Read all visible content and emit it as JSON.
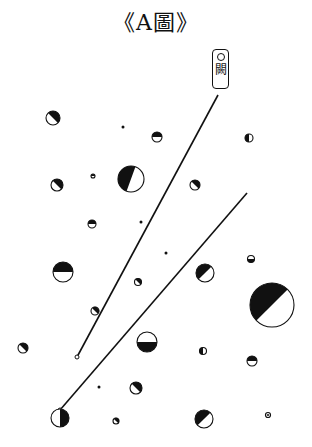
{
  "title": "《A圖》",
  "label": {
    "symbol": "○",
    "char": "闕"
  },
  "colors": {
    "ink": "#111111",
    "paper": "#ffffff"
  },
  "lines": [
    {
      "name": "line-1",
      "x1": 218,
      "y1": 95,
      "x2": 77,
      "y2": 357,
      "end_marker": "open-circle"
    },
    {
      "name": "line-2",
      "x1": 247,
      "y1": 193,
      "x2": 60,
      "y2": 410,
      "end_marker": "open-circle"
    }
  ],
  "circles": [
    {
      "cx": 53,
      "cy": 118,
      "r": 7,
      "shade": "upper-left"
    },
    {
      "cx": 123,
      "cy": 127,
      "r": 1.5,
      "shade": "dot"
    },
    {
      "cx": 157,
      "cy": 137,
      "r": 5,
      "shade": "left"
    },
    {
      "cx": 249,
      "cy": 138,
      "r": 4,
      "shade": "bottom"
    },
    {
      "cx": 57,
      "cy": 185,
      "r": 6,
      "shade": "upper-left"
    },
    {
      "cx": 93,
      "cy": 176,
      "r": 2,
      "shade": "left"
    },
    {
      "cx": 131,
      "cy": 179,
      "r": 13,
      "shade": "lower"
    },
    {
      "cx": 195,
      "cy": 185,
      "r": 5,
      "shade": "upper-left"
    },
    {
      "cx": 92,
      "cy": 224,
      "r": 4,
      "shade": "left"
    },
    {
      "cx": 141,
      "cy": 222,
      "r": 1.5,
      "shade": "dot"
    },
    {
      "cx": 63,
      "cy": 272,
      "r": 10,
      "shade": "left"
    },
    {
      "cx": 166,
      "cy": 253,
      "r": 1.5,
      "shade": "dot"
    },
    {
      "cx": 205,
      "cy": 273,
      "r": 9,
      "shade": "lower-left"
    },
    {
      "cx": 251,
      "cy": 259,
      "r": 3.5,
      "shade": "right"
    },
    {
      "cx": 138,
      "cy": 282,
      "r": 3.5,
      "shade": "upper-left"
    },
    {
      "cx": 95,
      "cy": 311,
      "r": 4,
      "shade": "upper-left"
    },
    {
      "cx": 147,
      "cy": 342,
      "r": 10,
      "shade": "right"
    },
    {
      "cx": 272,
      "cy": 305,
      "r": 22,
      "shade": "lower-left"
    },
    {
      "cx": 23,
      "cy": 348,
      "r": 5,
      "shade": "upper-left"
    },
    {
      "cx": 203,
      "cy": 351,
      "r": 3.5,
      "shade": "bottom"
    },
    {
      "cx": 252,
      "cy": 361,
      "r": 5,
      "shade": "left"
    },
    {
      "cx": 99,
      "cy": 387,
      "r": 1.5,
      "shade": "dot"
    },
    {
      "cx": 136,
      "cy": 388,
      "r": 6,
      "shade": "upper-left"
    },
    {
      "cx": 116,
      "cy": 421,
      "r": 3,
      "shade": "upper-left"
    },
    {
      "cx": 60,
      "cy": 418,
      "r": 9,
      "shade": "top"
    },
    {
      "cx": 204,
      "cy": 419,
      "r": 9,
      "shade": "lower-left"
    },
    {
      "cx": 268,
      "cy": 415,
      "r": 2.5,
      "shade": "ring"
    }
  ]
}
